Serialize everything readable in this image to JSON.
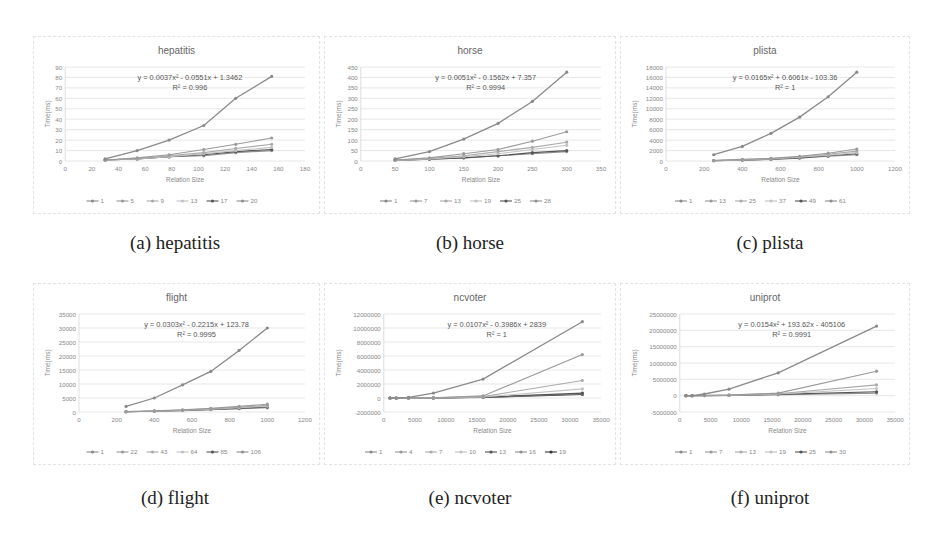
{
  "figure": {
    "captions": [
      "(a) hepatitis",
      "(b) horse",
      "(c) plista",
      "(d) flight",
      "(e) ncvoter",
      "(f) uniprot"
    ]
  },
  "colors": {
    "series": [
      "#8a8a8a",
      "#9a9a9a",
      "#aaaaaa",
      "#c2c2c2",
      "#555555",
      "#8f8f8f",
      "#333333"
    ],
    "grid": "#dcdcdc",
    "axis_text": "#888888",
    "title_text": "#666666"
  },
  "chart_data": [
    {
      "type": "line",
      "title": "hepatitis",
      "xlabel": "Relation Size",
      "ylabel": "Time(ms)",
      "xlim": [
        0,
        180
      ],
      "ylim": [
        0,
        90
      ],
      "xticks": [
        0,
        20,
        40,
        60,
        80,
        100,
        120,
        140,
        160,
        180
      ],
      "yticks": [
        0,
        10,
        20,
        30,
        40,
        50,
        60,
        70,
        80,
        90
      ],
      "grid": true,
      "legend_position": "bottom",
      "trendline": {
        "equation": "y = 0.0037x² - 0.0551x + 1.3462",
        "r2": "R² = 0.996"
      },
      "x": [
        30,
        54,
        78,
        104,
        128,
        155
      ],
      "series": [
        {
          "name": "1",
          "values": [
            2,
            10,
            20,
            34,
            60,
            81
          ]
        },
        {
          "name": "5",
          "values": [
            1,
            3,
            6,
            11,
            16,
            22
          ]
        },
        {
          "name": "9",
          "values": [
            1,
            2,
            5,
            8,
            12,
            16
          ]
        },
        {
          "name": "13",
          "values": [
            1,
            2,
            4,
            7,
            10,
            13
          ]
        },
        {
          "name": "17",
          "values": [
            1,
            2,
            4,
            6,
            9,
            11
          ]
        },
        {
          "name": "20",
          "values": [
            1,
            2,
            4,
            5,
            8,
            10
          ]
        }
      ]
    },
    {
      "type": "line",
      "title": "horse",
      "xlabel": "Relation Size",
      "ylabel": "Time(ms)",
      "xlim": [
        0,
        350
      ],
      "ylim": [
        0,
        450
      ],
      "xticks": [
        0,
        50,
        100,
        150,
        200,
        250,
        300,
        350
      ],
      "yticks": [
        0,
        50,
        100,
        150,
        200,
        250,
        300,
        350,
        400,
        450
      ],
      "grid": true,
      "legend_position": "bottom",
      "trendline": {
        "equation": "y = 0.0051x² - 0.1562x + 7.357",
        "r2": "R² = 0.9994"
      },
      "x": [
        50,
        100,
        150,
        200,
        250,
        300
      ],
      "series": [
        {
          "name": "1",
          "values": [
            10,
            45,
            105,
            180,
            285,
            425
          ]
        },
        {
          "name": "7",
          "values": [
            5,
            15,
            35,
            55,
            95,
            140
          ]
        },
        {
          "name": "13",
          "values": [
            5,
            12,
            25,
            45,
            65,
            90
          ]
        },
        {
          "name": "19",
          "values": [
            3,
            10,
            20,
            35,
            55,
            75
          ]
        },
        {
          "name": "25",
          "values": [
            3,
            8,
            15,
            25,
            40,
            50
          ]
        },
        {
          "name": "28",
          "values": [
            3,
            8,
            15,
            25,
            35,
            45
          ]
        }
      ]
    },
    {
      "type": "line",
      "title": "plista",
      "xlabel": "Relation Size",
      "ylabel": "Time(ms)",
      "xlim": [
        0,
        1200
      ],
      "ylim": [
        0,
        18000
      ],
      "xticks": [
        0,
        200,
        400,
        600,
        800,
        1000,
        1200
      ],
      "yticks": [
        0,
        2000,
        4000,
        6000,
        8000,
        10000,
        12000,
        14000,
        16000,
        18000
      ],
      "grid": true,
      "legend_position": "bottom",
      "trendline": {
        "equation": "y = 0.0165x² + 0.6061x - 103.36",
        "r2": "R² = 1"
      },
      "x": [
        250,
        400,
        550,
        700,
        850,
        1000
      ],
      "series": [
        {
          "name": "1",
          "values": [
            1200,
            2800,
            5300,
            8400,
            12300,
            17000
          ]
        },
        {
          "name": "13",
          "values": [
            100,
            300,
            500,
            900,
            1500,
            2300
          ]
        },
        {
          "name": "25",
          "values": [
            100,
            250,
            450,
            800,
            1300,
            1900
          ]
        },
        {
          "name": "37",
          "values": [
            80,
            200,
            400,
            700,
            1100,
            1600
          ]
        },
        {
          "name": "49",
          "values": [
            70,
            180,
            350,
            600,
            1000,
            1400
          ]
        },
        {
          "name": "61",
          "values": [
            60,
            150,
            300,
            550,
            900,
            1200
          ]
        }
      ]
    },
    {
      "type": "line",
      "title": "flight",
      "xlabel": "Relation Size",
      "ylabel": "Time(ms)",
      "xlim": [
        0,
        1200
      ],
      "ylim": [
        0,
        35000
      ],
      "xticks": [
        0,
        200,
        400,
        600,
        800,
        1000,
        1200
      ],
      "yticks": [
        0,
        5000,
        10000,
        15000,
        20000,
        25000,
        30000,
        35000
      ],
      "grid": true,
      "legend_position": "bottom",
      "trendline": {
        "equation": "y = 0.0303x² - 0.2215x + 123.78",
        "r2": "R² = 0.9995"
      },
      "x": [
        250,
        400,
        550,
        700,
        850,
        1000
      ],
      "series": [
        {
          "name": "1",
          "values": [
            2000,
            5000,
            9700,
            14500,
            22000,
            30000
          ]
        },
        {
          "name": "22",
          "values": [
            150,
            400,
            800,
            1300,
            2000,
            2800
          ]
        },
        {
          "name": "43",
          "values": [
            120,
            350,
            700,
            1100,
            1700,
            2400
          ]
        },
        {
          "name": "64",
          "values": [
            100,
            300,
            600,
            1000,
            1500,
            2100
          ]
        },
        {
          "name": "85",
          "values": [
            90,
            280,
            550,
            900,
            1300,
            1800
          ]
        },
        {
          "name": "106",
          "values": [
            80,
            250,
            500,
            800,
            1200,
            1500
          ]
        }
      ]
    },
    {
      "type": "line",
      "title": "ncvoter",
      "xlabel": "Relation Size",
      "ylabel": "Time(ms)",
      "xlim": [
        0,
        35000
      ],
      "ylim": [
        -2000000,
        12000000
      ],
      "xticks": [
        0,
        5000,
        10000,
        15000,
        20000,
        25000,
        30000,
        35000
      ],
      "yticks": [
        -2000000,
        0,
        2000000,
        4000000,
        6000000,
        8000000,
        10000000,
        12000000
      ],
      "grid": true,
      "legend_position": "bottom",
      "trendline": {
        "equation": "y = 0.0107x² - 0.3986x + 2839",
        "r2": "R² = 1"
      },
      "x": [
        1000,
        2000,
        4000,
        8000,
        16000,
        32000
      ],
      "series": [
        {
          "name": "1",
          "values": [
            0,
            0,
            100000,
            700000,
            2700000,
            10900000
          ]
        },
        {
          "name": "4",
          "values": [
            0,
            0,
            20000,
            50000,
            300000,
            6200000
          ]
        },
        {
          "name": "7",
          "values": [
            0,
            0,
            10000,
            30000,
            200000,
            2500000
          ]
        },
        {
          "name": "10",
          "values": [
            0,
            0,
            10000,
            20000,
            150000,
            1300000
          ]
        },
        {
          "name": "13",
          "values": [
            0,
            0,
            5000,
            15000,
            120000,
            700000
          ]
        },
        {
          "name": "16",
          "values": [
            0,
            0,
            5000,
            10000,
            100000,
            600000
          ]
        },
        {
          "name": "19",
          "values": [
            0,
            0,
            5000,
            10000,
            90000,
            500000
          ]
        }
      ]
    },
    {
      "type": "line",
      "title": "uniprot",
      "xlabel": "Relation Size",
      "ylabel": "Time(ms)",
      "xlim": [
        0,
        35000
      ],
      "ylim": [
        -5000000,
        25000000
      ],
      "xticks": [
        0,
        5000,
        10000,
        15000,
        20000,
        25000,
        30000,
        35000
      ],
      "yticks": [
        -5000000,
        0,
        5000000,
        10000000,
        15000000,
        20000000,
        25000000
      ],
      "grid": true,
      "legend_position": "bottom",
      "trendline": {
        "equation": "y = 0.0154x² + 193.62x - 405106",
        "r2": "R² = 0.9991"
      },
      "x": [
        1000,
        2000,
        4000,
        8000,
        16000,
        32000
      ],
      "series": [
        {
          "name": "1",
          "values": [
            0,
            0,
            500000,
            2000000,
            7000000,
            21300000
          ]
        },
        {
          "name": "7",
          "values": [
            0,
            0,
            100000,
            200000,
            800000,
            7500000
          ]
        },
        {
          "name": "13",
          "values": [
            0,
            0,
            50000,
            150000,
            600000,
            3300000
          ]
        },
        {
          "name": "19",
          "values": [
            0,
            0,
            40000,
            100000,
            500000,
            2200000
          ]
        },
        {
          "name": "25",
          "values": [
            0,
            0,
            30000,
            80000,
            400000,
            1200000
          ]
        },
        {
          "name": "30",
          "values": [
            0,
            0,
            20000,
            60000,
            300000,
            800000
          ]
        }
      ]
    }
  ]
}
